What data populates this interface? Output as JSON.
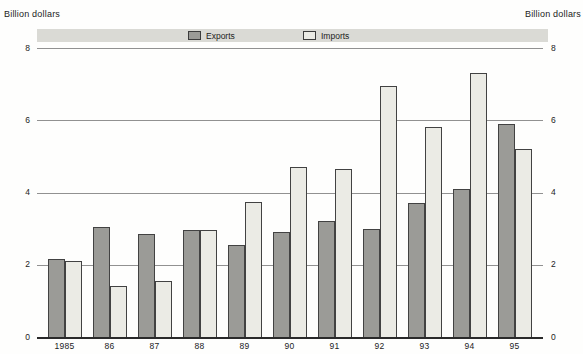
{
  "header": {
    "left_axis_title": "Billion dollars",
    "right_axis_title": "Billion dollars"
  },
  "legend": {
    "exports_label": "Exports",
    "imports_label": "Imports",
    "band_color": "#dadad5"
  },
  "colors": {
    "exports_fill": "#9b9b97",
    "imports_fill": "#ebebe5",
    "gridline": "#919191",
    "baseline": "#2a2a2a",
    "text": "#1c1c1c"
  },
  "chart_data": {
    "type": "bar",
    "title": "",
    "ylabel_left": "Billion dollars",
    "ylabel_right": "Billion dollars",
    "xlabel": "",
    "categories": [
      "1985",
      "86",
      "87",
      "88",
      "89",
      "90",
      "91",
      "92",
      "93",
      "94",
      "95"
    ],
    "series": [
      {
        "name": "Exports",
        "color": "#9b9b97",
        "values": [
          2.15,
          3.05,
          2.85,
          2.95,
          2.55,
          2.9,
          3.2,
          3.0,
          3.7,
          4.1,
          5.9
        ]
      },
      {
        "name": "Imports",
        "color": "#ebebe5",
        "values": [
          2.1,
          1.4,
          1.55,
          2.95,
          3.75,
          4.7,
          4.65,
          6.95,
          5.8,
          7.3,
          5.2
        ]
      }
    ],
    "ylim": [
      0,
      8
    ],
    "yticks": [
      0,
      2,
      4,
      6,
      8
    ],
    "grid": true,
    "legend_position": "top"
  }
}
